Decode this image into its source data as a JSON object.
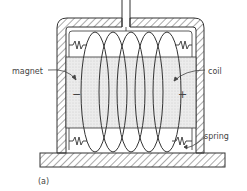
{
  "diagram": {
    "labels": {
      "magnet": "magnet",
      "coil": "coil",
      "spring": "spring",
      "panel": "(a)"
    },
    "polarity": {
      "left": "−",
      "right": "+"
    },
    "colors": {
      "line": "#333333",
      "hatch": "#555555",
      "magnet_fill": "#e6e6e6",
      "background": "#ffffff"
    },
    "coil_turns": 5,
    "springs": 4
  }
}
